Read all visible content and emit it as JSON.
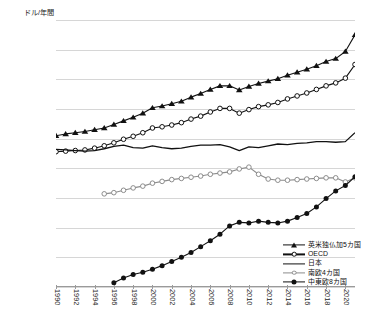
{
  "chart_data": {
    "type": "line",
    "title": "",
    "ylabel": "ドル/年間",
    "xlabel": "",
    "ylim": [
      15000,
      60000
    ],
    "ystep": 5000,
    "yticks": [
      "60,000",
      "55,000",
      "50,000",
      "45,000",
      "40,000",
      "35,000",
      "30,000",
      "25,000",
      "20,000",
      "15,000"
    ],
    "xlim": [
      1990,
      2021
    ],
    "xticks": [
      "1990",
      "1992",
      "1994",
      "1996",
      "1998",
      "2000",
      "2002",
      "2004",
      "2006",
      "2008",
      "2010",
      "2012",
      "2014",
      "2016",
      "2018",
      "2020"
    ],
    "grid": "horizontal",
    "legend_position": "bottom-right-inside",
    "x": [
      1990,
      1991,
      1992,
      1993,
      1994,
      1995,
      1996,
      1997,
      1998,
      1999,
      2000,
      2001,
      2002,
      2003,
      2004,
      2005,
      2006,
      2007,
      2008,
      2009,
      2010,
      2011,
      2012,
      2013,
      2014,
      2015,
      2016,
      2017,
      2018,
      2019,
      2020,
      2021
    ],
    "series": [
      {
        "name": "英米独仏加5カ国",
        "marker": "filled-triangle",
        "color": "#111111",
        "values": [
          40500,
          40800,
          41000,
          41200,
          41500,
          41800,
          42400,
          43000,
          43600,
          44300,
          45200,
          45500,
          45900,
          46300,
          47000,
          47600,
          48300,
          48900,
          48900,
          48200,
          48800,
          49300,
          49700,
          50100,
          50700,
          51200,
          51700,
          52300,
          53000,
          53500,
          54700,
          57500
        ]
      },
      {
        "name": "OECD",
        "marker": "open-circle",
        "color": "#111111",
        "values": [
          37800,
          37900,
          38000,
          38100,
          38400,
          38800,
          39300,
          39900,
          40400,
          41000,
          41800,
          42000,
          42300,
          42700,
          43300,
          43800,
          44500,
          45100,
          45100,
          44300,
          44900,
          45400,
          45700,
          46100,
          46700,
          47200,
          47700,
          48300,
          48900,
          49400,
          50200,
          52500
        ]
      },
      {
        "name": "日本",
        "marker": "none",
        "color": "#111111",
        "values": [
          38200,
          38100,
          38000,
          37900,
          38000,
          38300,
          38700,
          38900,
          38500,
          38400,
          38800,
          38500,
          38300,
          38400,
          38700,
          38900,
          38900,
          39000,
          38600,
          38000,
          38600,
          38500,
          38800,
          39100,
          39000,
          39200,
          39300,
          39500,
          39500,
          39400,
          39500,
          41000
        ]
      },
      {
        "name": "南欧4カ国",
        "marker": "open-circle-grey",
        "color": "#8c8c8c",
        "values": [
          null,
          null,
          null,
          null,
          null,
          30700,
          30900,
          31300,
          31700,
          32000,
          32500,
          32800,
          33100,
          33300,
          33500,
          33700,
          34000,
          34200,
          34400,
          34900,
          35200,
          34000,
          33200,
          33000,
          33000,
          33100,
          33200,
          33300,
          33400,
          33400,
          32700,
          33400
        ]
      },
      {
        "name": "中東欧8カ国",
        "marker": "filled-circle",
        "color": "#111111",
        "values": [
          null,
          null,
          null,
          null,
          null,
          null,
          15700,
          16500,
          17100,
          17500,
          18000,
          18600,
          19300,
          20000,
          20800,
          21800,
          22800,
          23900,
          25300,
          25900,
          25800,
          26100,
          25900,
          25800,
          26100,
          26700,
          27400,
          28500,
          29900,
          31200,
          32100,
          33600
        ]
      }
    ]
  },
  "legend": {
    "items": [
      {
        "label": "英米独仏加5カ国",
        "marker": "filled-triangle"
      },
      {
        "label": "OECD",
        "marker": "open-circle"
      },
      {
        "label": "日本",
        "marker": "line"
      },
      {
        "label": "南欧4カ国",
        "marker": "open-circle-grey"
      },
      {
        "label": "中東欧8カ国",
        "marker": "filled-circle"
      }
    ]
  }
}
